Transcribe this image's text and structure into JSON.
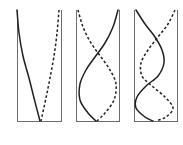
{
  "figure": {
    "title": "",
    "background_color": "#ffffff",
    "width": 183,
    "height": 145,
    "frame_color": "#6b6b6b",
    "curve_color": "#231f20",
    "panel_count": 3,
    "legend": {
      "solid_label": "",
      "dashed_label": ""
    }
  },
  "chart_data": {
    "type": "line",
    "title": "",
    "subtitle": "",
    "xlabel": "",
    "ylabel": "",
    "grid": false,
    "legend_position": "none",
    "axis_orientation": "vertical",
    "xlim": [
      -1,
      1
    ],
    "ylim": [
      0,
      1
    ],
    "panels": [
      {
        "index": 1,
        "name": "mode-1",
        "label": "",
        "half_waves": 1,
        "frame": {
          "left": 17,
          "right": 61,
          "top": 10,
          "bottom": 121,
          "top_open": true
        },
        "series": [
          {
            "name": "solid",
            "style": "solid",
            "points_xy": [
              [
                17,
                10
              ],
              [
                19,
                33
              ],
              [
                23,
                56
              ],
              [
                29,
                78
              ],
              [
                34,
                98
              ],
              [
                40,
                121
              ]
            ]
          },
          {
            "name": "dashed",
            "style": "dashed",
            "points_xy": [
              [
                59,
                10
              ],
              [
                57,
                33
              ],
              [
                54,
                56
              ],
              [
                50,
                78
              ],
              [
                46,
                98
              ],
              [
                41,
                121
              ]
            ]
          }
        ]
      },
      {
        "index": 2,
        "name": "mode-2",
        "label": "",
        "half_waves": 2,
        "frame": {
          "left": 76,
          "right": 119,
          "top": 10,
          "bottom": 121,
          "top_open": true
        },
        "series": [
          {
            "name": "solid",
            "style": "solid",
            "points_xy": [
              [
                118,
                10
              ],
              [
                113,
                27
              ],
              [
                105,
                43
              ],
              [
                95,
                57
              ],
              [
                86,
                70
              ],
              [
                80,
                84
              ],
              [
                80,
                100
              ],
              [
                88,
                113
              ],
              [
                96,
                121
              ]
            ]
          },
          {
            "name": "dashed",
            "style": "dashed",
            "points_xy": [
              [
                78,
                10
              ],
              [
                83,
                27
              ],
              [
                91,
                43
              ],
              [
                101,
                57
              ],
              [
                110,
                70
              ],
              [
                116,
                84
              ],
              [
                114,
                100
              ],
              [
                105,
                113
              ],
              [
                97,
                121
              ]
            ]
          }
        ]
      },
      {
        "index": 3,
        "name": "mode-3",
        "label": "",
        "half_waves": 3,
        "frame": {
          "left": 134,
          "right": 177,
          "top": 10,
          "bottom": 121,
          "top_open": true
        },
        "series": [
          {
            "name": "solid",
            "style": "solid",
            "points_xy": [
              [
                136,
                10
              ],
              [
                145,
                24
              ],
              [
                155,
                37
              ],
              [
                162,
                50
              ],
              [
                164,
                63
              ],
              [
                158,
                76
              ],
              [
                146,
                86
              ],
              [
                137,
                97
              ],
              [
                136,
                108
              ],
              [
                145,
                117
              ],
              [
                153,
                121
              ]
            ]
          },
          {
            "name": "dashed",
            "style": "dashed",
            "points_xy": [
              [
                175,
                10
              ],
              [
                168,
                24
              ],
              [
                158,
                37
              ],
              [
                148,
                50
              ],
              [
                141,
                63
              ],
              [
                142,
                76
              ],
              [
                152,
                86
              ],
              [
                165,
                97
              ],
              [
                173,
                108
              ],
              [
                166,
                117
              ],
              [
                156,
                121
              ]
            ]
          }
        ]
      }
    ]
  }
}
